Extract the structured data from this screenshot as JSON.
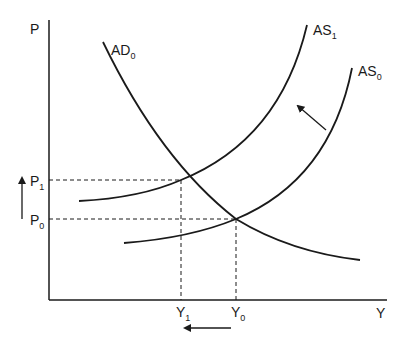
{
  "diagram": {
    "title": "",
    "axes": {
      "y_label": "P",
      "x_label": "Y"
    },
    "curves": {
      "ad0": {
        "label": "AD",
        "subscript": "0"
      },
      "as1": {
        "label": "AS",
        "subscript": "1"
      },
      "as0": {
        "label": "AS",
        "subscript": "0"
      }
    },
    "price_levels": [
      {
        "label": "P",
        "subscript": "1"
      },
      {
        "label": "P",
        "subscript": "0"
      }
    ],
    "output_levels": [
      {
        "label": "Y",
        "subscript": "1"
      },
      {
        "label": "Y",
        "subscript": "0"
      }
    ],
    "annotations": {
      "shift_arrow": "AS shifts left (AS0 to AS1)",
      "price_arrow": "price level rises (P0 to P1)",
      "output_arrow": "output falls (Y0 to Y1)"
    },
    "colors": {
      "line": "#1a1a1a",
      "background": "#ffffff"
    }
  }
}
